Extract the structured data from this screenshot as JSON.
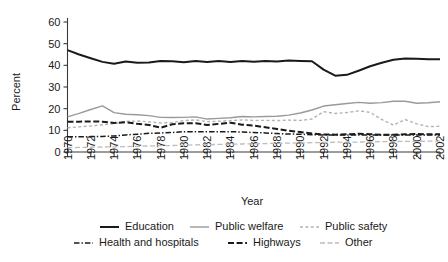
{
  "chart_data": {
    "type": "line",
    "title": "",
    "xlabel": "Year",
    "ylabel": "Percent",
    "xlim": [
      1970,
      2002
    ],
    "ylim": [
      0,
      60
    ],
    "grid": false,
    "legend_position": "bottom",
    "x": [
      1970,
      1971,
      1972,
      1973,
      1974,
      1975,
      1976,
      1977,
      1978,
      1979,
      1980,
      1981,
      1982,
      1983,
      1984,
      1985,
      1986,
      1987,
      1988,
      1989,
      1990,
      1991,
      1992,
      1993,
      1994,
      1995,
      1996,
      1997,
      1998,
      1999,
      2000,
      2001,
      2002
    ],
    "xticks": [
      1970,
      1972,
      1974,
      1976,
      1978,
      1980,
      1982,
      1984,
      1986,
      1988,
      1990,
      1992,
      1994,
      1996,
      1998,
      2000,
      2002
    ],
    "xtick_labels": [
      "1970",
      "1972",
      "1974",
      "1976",
      "1978",
      "1980",
      "1982",
      "1984",
      "1986",
      "1988",
      "1990",
      "1992",
      "1994",
      "1996",
      "1998",
      "2000",
      "2002"
    ],
    "yticks": [
      0,
      10,
      20,
      30,
      40,
      50,
      60
    ],
    "ytick_labels": [
      "0",
      "10",
      "20",
      "30",
      "40",
      "50",
      "60"
    ],
    "series": [
      {
        "name": "Education",
        "color": "#1a1a1a",
        "width": 2.0,
        "dash": "none",
        "values": [
          47.0,
          45.0,
          43.3,
          41.6,
          40.7,
          41.8,
          41.2,
          41.3,
          42.0,
          41.9,
          41.4,
          42.0,
          41.5,
          42.0,
          41.5,
          42.0,
          41.6,
          42.0,
          41.8,
          42.2,
          42.0,
          41.9,
          38.0,
          35.2,
          35.6,
          37.5,
          39.6,
          41.2,
          42.6,
          43.2,
          43.0,
          42.8,
          42.8
        ]
      },
      {
        "name": "Public welfare",
        "color": "#9a9a9a",
        "width": 1.4,
        "dash": "none",
        "values": [
          16.2,
          17.8,
          19.6,
          21.3,
          18.2,
          17.4,
          17.2,
          16.8,
          16.0,
          15.9,
          16.0,
          16.2,
          15.2,
          15.5,
          15.8,
          16.4,
          16.2,
          16.4,
          16.5,
          17.0,
          18.0,
          19.4,
          21.2,
          21.8,
          22.4,
          22.9,
          22.5,
          22.8,
          23.4,
          23.4,
          22.5,
          22.7,
          23.2
        ]
      },
      {
        "name": "Public safety",
        "color": "#b3b3b3",
        "width": 1.4,
        "dash": "3,2.4",
        "values": [
          11.2,
          11.6,
          12.0,
          12.6,
          13.1,
          14.1,
          14.3,
          13.9,
          13.4,
          13.6,
          14.5,
          14.8,
          14.0,
          14.2,
          14.5,
          14.8,
          14.6,
          14.6,
          14.5,
          14.7,
          14.6,
          15.2,
          18.6,
          17.8,
          18.2,
          19.0,
          18.3,
          15.0,
          12.4,
          15.0,
          13.0,
          11.7,
          11.9
        ]
      },
      {
        "name": "Health and hospitals",
        "color": "#1a1a1a",
        "width": 1.5,
        "dash": "5.5,2,1.4,2",
        "values": [
          7.0,
          7.0,
          7.1,
          7.2,
          7.4,
          7.9,
          8.2,
          8.6,
          8.8,
          9.0,
          9.4,
          9.4,
          9.4,
          9.4,
          9.4,
          9.2,
          9.0,
          8.8,
          8.5,
          8.3,
          8.2,
          8.0,
          7.9,
          7.9,
          7.9,
          7.9,
          7.9,
          7.8,
          7.8,
          7.9,
          7.9,
          7.9,
          7.9
        ]
      },
      {
        "name": "Highways",
        "color": "#1a1a1a",
        "width": 2.0,
        "dash": "6,2.6",
        "values": [
          14.0,
          14.0,
          14.1,
          14.0,
          13.4,
          13.7,
          13.0,
          12.5,
          11.2,
          12.8,
          13.3,
          13.3,
          12.5,
          13.0,
          13.5,
          12.6,
          12.2,
          11.4,
          10.6,
          9.8,
          9.2,
          8.6,
          8.1,
          8.0,
          8.2,
          8.4,
          8.2,
          8.0,
          8.0,
          8.2,
          8.3,
          8.2,
          8.2
        ]
      },
      {
        "name": "Other",
        "color": "#bdbdbd",
        "width": 1.3,
        "dash": "5,2.5",
        "values": [
          2.0,
          2.1,
          2.2,
          2.3,
          2.4,
          2.5,
          2.6,
          2.8,
          2.9,
          3.0,
          3.1,
          3.3,
          3.4,
          3.5,
          3.6,
          3.7,
          3.8,
          3.9,
          4.0,
          4.1,
          4.2,
          4.3,
          4.4,
          4.5,
          4.6,
          4.6,
          4.7,
          4.8,
          4.8,
          4.9,
          4.9,
          5.0,
          5.0
        ]
      }
    ]
  },
  "legend": {
    "items": [
      {
        "label": "Education",
        "series": "Education"
      },
      {
        "label": "Public welfare",
        "series": "Public welfare"
      },
      {
        "label": "Public safety",
        "series": "Public safety"
      },
      {
        "label": "Health and hospitals",
        "series": "Health and hospitals"
      },
      {
        "label": "Highways",
        "series": "Highways"
      },
      {
        "label": "Other",
        "series": "Other"
      }
    ]
  }
}
